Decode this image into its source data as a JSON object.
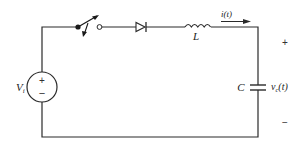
{
  "diagram": {
    "type": "circuit",
    "source": {
      "label": "V",
      "subscript": "i",
      "plus": "+",
      "minus": "−"
    },
    "switch": {
      "state": "open"
    },
    "diode": {
      "direction": "right"
    },
    "inductor": {
      "label": "L"
    },
    "current": {
      "label": "i(t)"
    },
    "capacitor": {
      "label": "C",
      "voltage_label": "v",
      "voltage_subscript": "c",
      "voltage_suffix": "(t)"
    },
    "output_polarity": {
      "plus": "+",
      "minus": "−"
    },
    "colors": {
      "line": "#2a2a2a",
      "background": "#ffffff"
    }
  }
}
